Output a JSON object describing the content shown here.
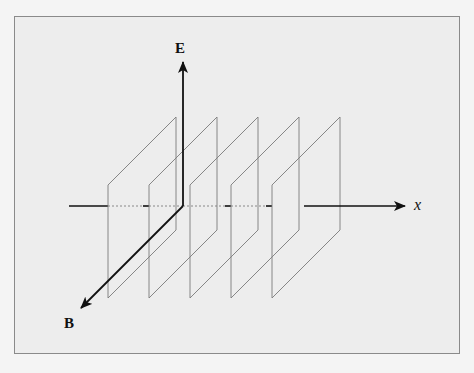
{
  "figure": {
    "labels": {
      "e_axis": "E",
      "b_axis": "B",
      "x_axis": "x"
    },
    "origin": [
      183,
      206
    ],
    "plane_count": 5,
    "plane_offsets_x": [
      0,
      41,
      82,
      123,
      164
    ],
    "colors": {
      "background": "#ededed",
      "frame_border": "#8a8a8a",
      "axis": "#111111",
      "plane_edge": "#7a7a7a",
      "dashed_axis": "#888888"
    }
  }
}
